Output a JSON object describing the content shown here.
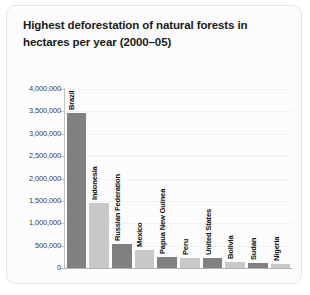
{
  "card": {
    "title": "Highest deforestation of natural forests in hectares per year (2000–05)",
    "border_color": "#e6e6e6",
    "background": "#fcfcfc"
  },
  "chart_data": {
    "type": "bar",
    "title": "Highest deforestation of natural forests in hectares per year (2000–05)",
    "xlabel": "",
    "ylabel": "",
    "ylim": [
      0,
      4000000
    ],
    "grid": true,
    "legend": "none",
    "categories": [
      "Brazil",
      "Indonesia",
      "Russian Federation",
      "Mexico",
      "Papua New Guinea",
      "Peru",
      "United States",
      "Bolivia",
      "Sudan",
      "Nigeria"
    ],
    "values": [
      3466000,
      1447000,
      532000,
      395000,
      250000,
      224000,
      215000,
      135000,
      117000,
      82000
    ],
    "ytick_labels": [
      "4,000,000",
      "3,500,000",
      "3,000,000",
      "2,500,000",
      "2,000,000",
      "1,500,000",
      "1,000,000",
      "500,000",
      "0"
    ],
    "ytick_values": [
      4000000,
      3500000,
      3000000,
      2500000,
      2000000,
      1500000,
      1000000,
      500000,
      0
    ],
    "bar_colors": [
      "#808080",
      "#c8c8c8",
      "#808080",
      "#c8c8c8",
      "#808080",
      "#c8c8c8",
      "#808080",
      "#c8c8c8",
      "#808080",
      "#c8c8c8"
    ],
    "axis_color": "#c0c0c0",
    "grid_color": "#f2f2f2"
  }
}
